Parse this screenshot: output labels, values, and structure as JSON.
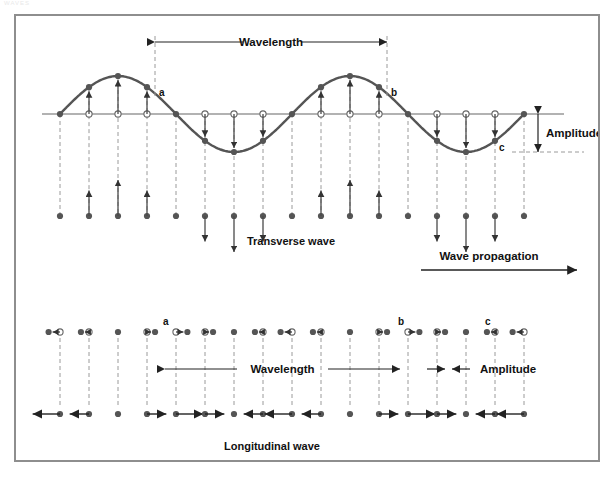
{
  "page": {
    "top_note": "WAVES",
    "background": "#ffffff",
    "frame_color": "#8e8e8e"
  },
  "colors": {
    "wave_curve": "#555555",
    "axis": "#666666",
    "dashed": "#9a9a9a",
    "arrow": "#4a4a4a",
    "dot_fill": "#555555",
    "dot_open": "#ffffff",
    "text": "#111111"
  },
  "labels": {
    "wavelength_top": "Wavelength",
    "wavelength_bottom": "Wavelength",
    "amplitude_top": "Amplitude",
    "amplitude_bottom": "Amplitude",
    "wave_propagation": "Wave propagation",
    "transverse_caption": "Transverse wave",
    "longitudinal_caption": "Longitudinal wave",
    "point_a_top": "a",
    "point_b_top": "b",
    "point_c_top": "c",
    "point_a_bottom": "a",
    "point_b_bottom": "b",
    "point_c_bottom": "c"
  },
  "chart_data": {
    "type": "line",
    "xlabel": "Wave propagation",
    "ylabel": "Displacement",
    "grid": false,
    "legend": null,
    "transverse": {
      "description": "Sinusoidal transverse wave with particle displacement arrows",
      "axis_y": 112,
      "amplitude_px": 38,
      "wavelength_px": 232,
      "x_start": 60,
      "x_end": 524,
      "n_particles": 17,
      "particle_spacing_px": 29,
      "marked_points": [
        {
          "label": "a",
          "x": 155,
          "phase": "descending-crest"
        },
        {
          "label": "b",
          "x": 387,
          "phase": "descending-crest"
        },
        {
          "label": "c",
          "x": 495,
          "phase": "ascending-trough"
        }
      ],
      "wavelength_span": [
        155,
        387
      ],
      "amplitude_span_y": [
        112,
        150
      ]
    },
    "longitudinal": {
      "description": "Longitudinal wave particle rows showing compressions and rarefactions",
      "row_top_y": 330,
      "row_bottom_y": 412,
      "x_start": 60,
      "x_end": 524,
      "n_particles": 17,
      "particle_spacing_px": 29,
      "wavelength_span": [
        165,
        400
      ],
      "amplitude_span": [
        445,
        470
      ],
      "marked_points": [
        {
          "label": "a",
          "x": 165
        },
        {
          "label": "b",
          "x": 400
        },
        {
          "label": "c",
          "x": 487
        }
      ]
    }
  }
}
